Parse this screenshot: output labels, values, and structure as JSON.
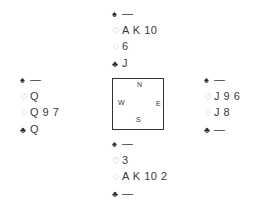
{
  "suits": {
    "spade": "♠",
    "heart": "♡",
    "diamond": "♢",
    "club": "♣"
  },
  "hands": {
    "north": {
      "spades": "—",
      "hearts": "A K 10",
      "diamonds": "6",
      "clubs": "J"
    },
    "west": {
      "spades": "—",
      "hearts": "Q",
      "diamonds": "Q 9 7",
      "clubs": "Q"
    },
    "east": {
      "spades": "—",
      "hearts": "J 9 6",
      "diamonds": "J 8",
      "clubs": "—"
    },
    "south": {
      "spades": "—",
      "hearts": "3",
      "diamonds": "A K 10 2",
      "clubs": "—"
    }
  },
  "compass": {
    "north": "N",
    "west": "W",
    "east": "E",
    "south": "S"
  }
}
